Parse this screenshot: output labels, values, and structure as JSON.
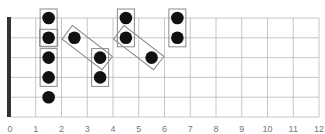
{
  "diagram": {
    "type": "guitar-fretboard",
    "strings": 6,
    "frets": 12,
    "fret_labels": [
      "0",
      "1",
      "2",
      "3",
      "4",
      "5",
      "6",
      "7",
      "8",
      "9",
      "10",
      "11",
      "12"
    ],
    "colors": {
      "grid": "#b8b8b8",
      "nut": "#333333",
      "dot": "#111111",
      "box": "#8a8a8a",
      "label": "#777777"
    },
    "notes": [
      {
        "string": 1,
        "fret": 2
      },
      {
        "string": 2,
        "fret": 2
      },
      {
        "string": 3,
        "fret": 2
      },
      {
        "string": 4,
        "fret": 2
      },
      {
        "string": 5,
        "fret": 2
      },
      {
        "string": 2,
        "fret": 3
      },
      {
        "string": 3,
        "fret": 4
      },
      {
        "string": 4,
        "fret": 4
      },
      {
        "string": 1,
        "fret": 5
      },
      {
        "string": 2,
        "fret": 5
      },
      {
        "string": 3,
        "fret": 6
      },
      {
        "string": 1,
        "fret": 7
      },
      {
        "string": 2,
        "fret": 7
      }
    ],
    "groups": [
      {
        "from": {
          "string": 1,
          "fret": 2
        },
        "to": {
          "string": 2,
          "fret": 2
        }
      },
      {
        "from": {
          "string": 2,
          "fret": 2
        },
        "to": {
          "string": 2,
          "fret": 2
        }
      },
      {
        "from": {
          "string": 3,
          "fret": 2
        },
        "to": {
          "string": 4,
          "fret": 2
        }
      },
      {
        "from": {
          "string": 2,
          "fret": 3
        },
        "to": {
          "string": 3,
          "fret": 4
        }
      },
      {
        "from": {
          "string": 3,
          "fret": 4
        },
        "to": {
          "string": 4,
          "fret": 4
        }
      },
      {
        "from": {
          "string": 1,
          "fret": 5
        },
        "to": {
          "string": 2,
          "fret": 5
        }
      },
      {
        "from": {
          "string": 2,
          "fret": 5
        },
        "to": {
          "string": 3,
          "fret": 6
        }
      },
      {
        "from": {
          "string": 1,
          "fret": 7
        },
        "to": {
          "string": 2,
          "fret": 7
        }
      }
    ]
  }
}
